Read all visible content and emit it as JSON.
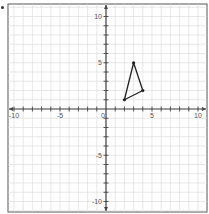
{
  "chart_data": {
    "type": "scatter",
    "title": "",
    "xlabel": "",
    "ylabel": "",
    "xlim": [
      -10,
      10
    ],
    "ylim": [
      -10,
      10
    ],
    "grid": true,
    "minor_grid": true,
    "x_ticks": [
      -10,
      -5,
      0,
      5,
      10
    ],
    "y_ticks": [
      -10,
      -5,
      5,
      10
    ],
    "x_tick_labels": [
      "-10",
      "-5",
      "0",
      "5",
      "10"
    ],
    "y_tick_labels": [
      "-10",
      "-5",
      "5",
      "10"
    ],
    "origin_label": "0",
    "series": [
      {
        "name": "triangle",
        "closed": true,
        "points": [
          [
            2,
            1
          ],
          [
            3,
            5
          ],
          [
            4,
            2
          ]
        ]
      }
    ]
  },
  "colors": {
    "grid": "#d9d9d9",
    "axis": "#444444",
    "shape": "#222222",
    "label": "#555555",
    "frame": "#555555"
  }
}
